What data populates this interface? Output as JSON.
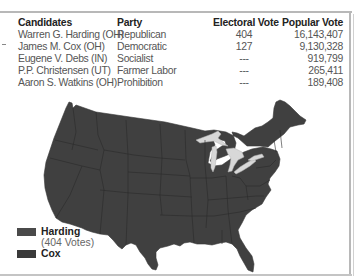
{
  "table": {
    "headers": [
      "Candidates",
      "Party",
      "Electoral Vote",
      "Popular Vote"
    ],
    "rows": [
      {
        "candidate": "Warren G. Harding (OH)",
        "party": "Republican",
        "electoral": "404",
        "popular": "16,143,407"
      },
      {
        "candidate": "James M. Cox (OH)",
        "party": "Democratic",
        "electoral": "127",
        "popular": "9,130,328"
      },
      {
        "candidate": "Eugene V. Debs (IN)",
        "party": "Socialist",
        "electoral": "---",
        "popular": "919,799"
      },
      {
        "candidate": "P.P. Christensen (UT)",
        "party": "Farmer Labor",
        "electoral": "---",
        "popular": "265,411"
      },
      {
        "candidate": "Aaron S. Watkins (OH)",
        "party": "Prohibition",
        "electoral": "---",
        "popular": "189,408"
      }
    ]
  },
  "legend": {
    "items": [
      {
        "label": "Harding",
        "sublabel": "(404 Votes)",
        "color": "#4a4a4a"
      },
      {
        "label": "Cox",
        "sublabel": "",
        "color": "#3a3a3a"
      }
    ]
  },
  "map": {
    "subject": "United States electoral map, 1920 presidential election",
    "state_fill": "#404040",
    "border_color": "#2a2a2a",
    "lakes_color": "#d8d8d8"
  },
  "colors": {
    "frame": "#b8b8b8",
    "header_text": "#222222",
    "body_text": "#555555"
  }
}
